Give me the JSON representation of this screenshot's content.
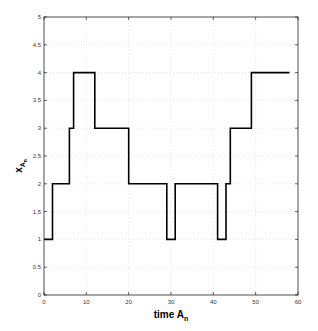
{
  "chart_data": {
    "type": "line",
    "style": "step",
    "title": "",
    "xlabel": "time A",
    "xlabel_subscript": "n",
    "ylabel": "x",
    "ylabel_subscript": "A",
    "ylabel_subsubscript": "n",
    "xlim": [
      0,
      60
    ],
    "ylim": [
      0,
      5
    ],
    "xticks": [
      0,
      10,
      20,
      30,
      40,
      50,
      60
    ],
    "yticks": [
      0,
      0.5,
      1,
      1.5,
      2,
      2.5,
      3,
      3.5,
      4,
      4.5,
      5
    ],
    "ytick_labels": [
      "0",
      "0.5",
      "1",
      "1.5",
      "2",
      "2.5",
      "3",
      "3.5",
      "4",
      "4.5",
      "5"
    ],
    "grid": true,
    "legend": null,
    "series": [
      {
        "name": "x_An",
        "color": "#000000",
        "x": [
          0,
          2,
          2,
          6,
          6,
          7,
          7,
          12,
          12,
          20,
          20,
          29,
          29,
          31,
          31,
          41,
          41,
          43,
          43,
          44,
          44,
          49,
          49,
          58
        ],
        "y": [
          1,
          1,
          2,
          2,
          3,
          3,
          4,
          4,
          3,
          3,
          2,
          2,
          1,
          1,
          2,
          2,
          1,
          1,
          2,
          2,
          3,
          3,
          4,
          4
        ]
      }
    ]
  }
}
